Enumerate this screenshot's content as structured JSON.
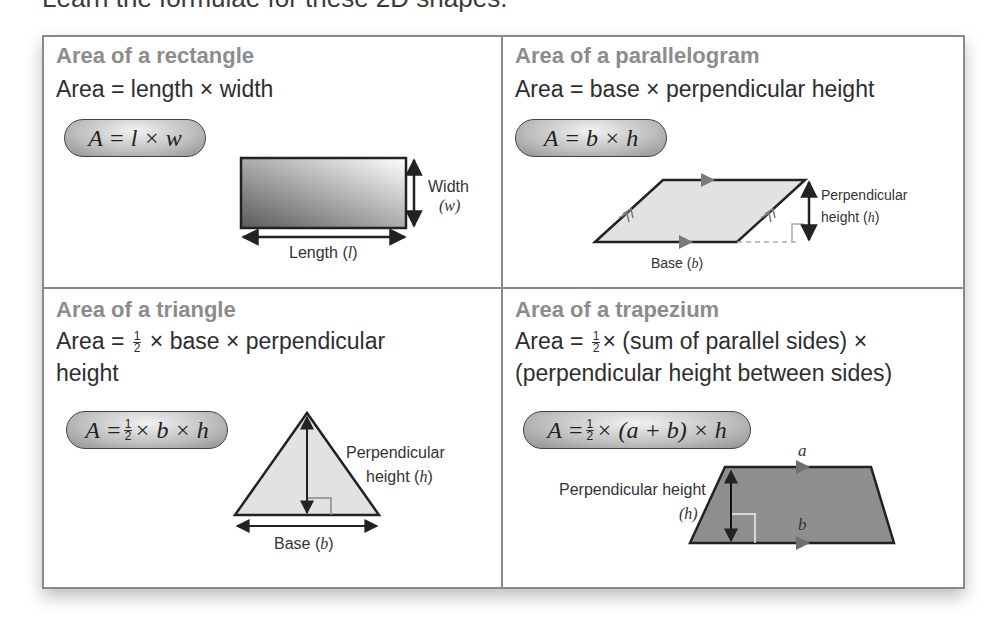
{
  "intro": "Learn the formulae for these 2D shapes.",
  "cells": {
    "rectangle": {
      "title": "Area of a rectangle",
      "rule": "Area = length × width",
      "formula": "A = l × w",
      "labels": {
        "width": "Width",
        "width_var": "(w)",
        "length": "Length (",
        "length_var": "l",
        "length_close": ")"
      }
    },
    "parallelogram": {
      "title": "Area of a parallelogram",
      "rule": "Area = base × perpendicular height",
      "formula": "A = b × h",
      "labels": {
        "height_line1": "Perpendicular",
        "height_line2": "height (",
        "height_var": "h",
        "height_close": ")",
        "base": "Base (",
        "base_var": "b",
        "base_close": ")"
      }
    },
    "triangle": {
      "title": "Area of a triangle",
      "rule_pre": "Area = ",
      "rule_frac_num": "1",
      "rule_frac_den": "2",
      "rule_post": " × base × perpendicular",
      "rule_line2": "height",
      "formula_pre": "A = ",
      "formula_frac_num": "1",
      "formula_frac_den": "2",
      "formula_post": "× b × h",
      "labels": {
        "height_line1": "Perpendicular",
        "height_line2": "height (",
        "height_var": "h",
        "height_close": ")",
        "base": "Base (",
        "base_var": "b",
        "base_close": ")"
      }
    },
    "trapezium": {
      "title": "Area of a trapezium",
      "rule_pre": "Area = ",
      "rule_frac_num": "1",
      "rule_frac_den": "2",
      "rule_post": "× (sum of parallel sides) ×",
      "rule_line2": "(perpendicular height between sides)",
      "formula_pre": "A = ",
      "formula_frac_num": "1",
      "formula_frac_den": "2",
      "formula_post": " × (a + b) × h",
      "labels": {
        "height": "Perpendicular height",
        "height_var": "(h)",
        "top_side": "a",
        "bottom_side": "b"
      }
    }
  },
  "colors": {
    "title_gray": "#8c8c8c",
    "border": "#8a8a8a",
    "shape_fill_light": "#dedede",
    "shape_fill_dark": "#8f8f8f",
    "arrow_gray": "#7a7a7a"
  }
}
